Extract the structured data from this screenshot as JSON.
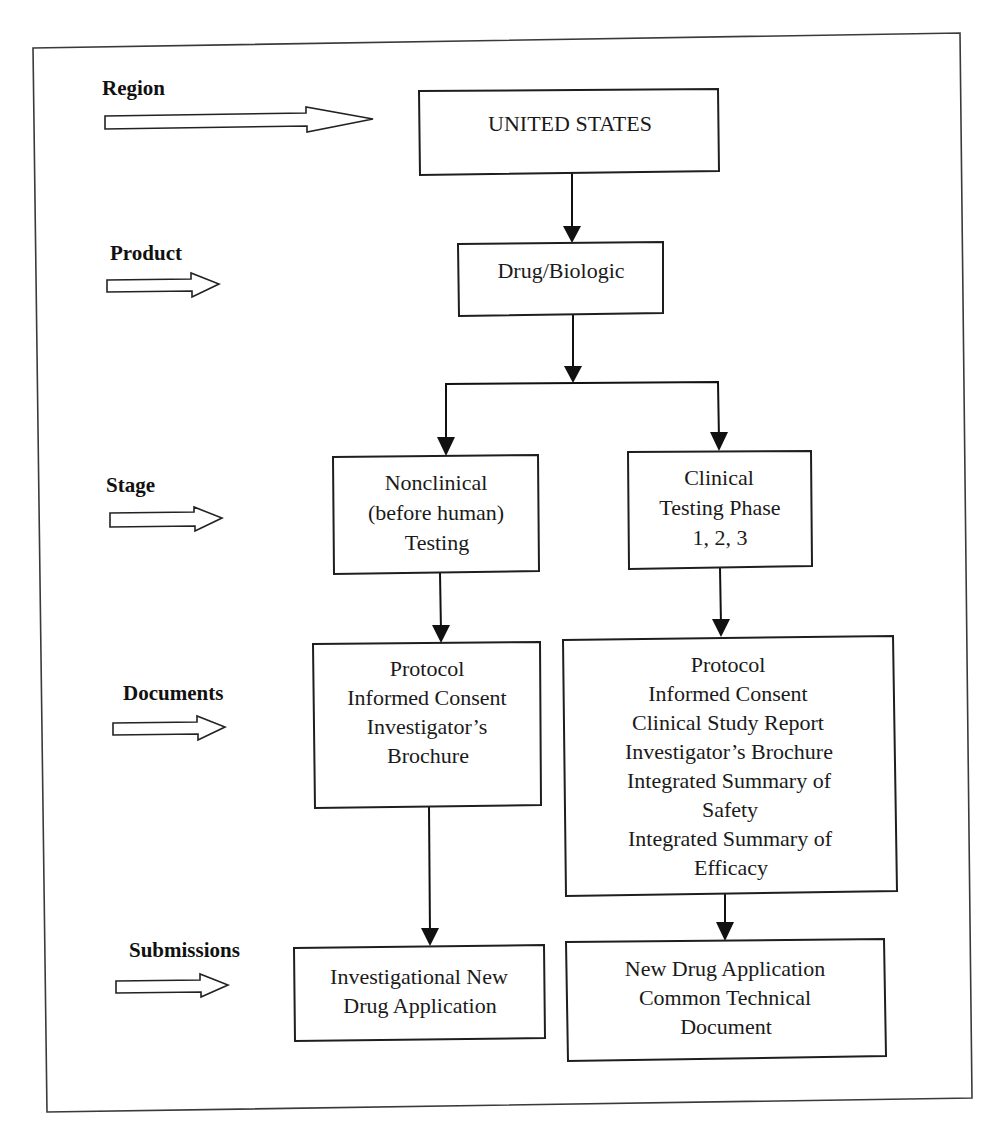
{
  "diagram": {
    "type": "flowchart",
    "row_labels": {
      "region": "Region",
      "product": "Product",
      "stage": "Stage",
      "documents": "Documents",
      "submissions": "Submissions"
    },
    "nodes": {
      "region": {
        "lines": [
          "UNITED STATES"
        ]
      },
      "product": {
        "lines": [
          "Drug/Biologic"
        ]
      },
      "stage_nonclinical": {
        "lines": [
          "Nonclinical",
          "(before human)",
          "Testing"
        ]
      },
      "stage_clinical": {
        "lines": [
          "Clinical",
          "Testing Phase",
          "1, 2, 3"
        ]
      },
      "docs_nonclinical": {
        "lines": [
          "Protocol",
          "Informed Consent",
          "Investigator’s",
          "Brochure"
        ]
      },
      "docs_clinical": {
        "lines": [
          "Protocol",
          "Informed Consent",
          "Clinical Study Report",
          "Investigator’s Brochure",
          "Integrated Summary of",
          "Safety",
          "Integrated Summary of",
          "Efficacy"
        ]
      },
      "submission_ind": {
        "lines": [
          "Investigational New",
          "Drug Application"
        ]
      },
      "submission_nda": {
        "lines": [
          "New Drug Application",
          "Common Technical",
          "Document"
        ]
      }
    },
    "edges": [
      [
        "region",
        "product"
      ],
      [
        "product",
        "stage_nonclinical"
      ],
      [
        "product",
        "stage_clinical"
      ],
      [
        "stage_nonclinical",
        "docs_nonclinical"
      ],
      [
        "stage_clinical",
        "docs_clinical"
      ],
      [
        "docs_nonclinical",
        "submission_ind"
      ],
      [
        "docs_clinical",
        "submission_nda"
      ]
    ]
  }
}
